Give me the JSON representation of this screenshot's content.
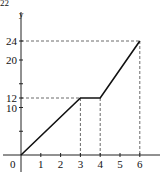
{
  "chart_data": {
    "type": "line",
    "title": "",
    "xlabel": "",
    "ylabel": "y",
    "origin_label": "0",
    "x": [
      0,
      3,
      4,
      6
    ],
    "series": [
      {
        "name": "y",
        "values": [
          0,
          12,
          12,
          24
        ]
      }
    ],
    "x_ticks": [
      1,
      2,
      3,
      4,
      5,
      6
    ],
    "x_tick_labels": [
      "1",
      "2",
      "3",
      "4",
      "5",
      "6"
    ],
    "y_ticks": [
      5,
      10,
      12,
      15,
      20,
      24
    ],
    "y_tick_labels": [
      "",
      "10",
      "12",
      "",
      "20",
      "24"
    ],
    "guide_lines": [
      {
        "from": [
          0,
          12
        ],
        "to": [
          3,
          12
        ]
      },
      {
        "from": [
          3,
          12
        ],
        "to": [
          3,
          0
        ]
      },
      {
        "from": [
          4,
          12
        ],
        "to": [
          4,
          0
        ]
      },
      {
        "from": [
          0,
          24
        ],
        "to": [
          6,
          24
        ]
      },
      {
        "from": [
          6,
          24
        ],
        "to": [
          6,
          0
        ]
      }
    ],
    "xlim": [
      -0.8,
      7
    ],
    "ylim": [
      -3,
      28
    ],
    "grid": false,
    "legend": null,
    "colors": {
      "line": "#111111",
      "axis": "#222222",
      "guide": "#444444"
    }
  },
  "corner_text": "22"
}
